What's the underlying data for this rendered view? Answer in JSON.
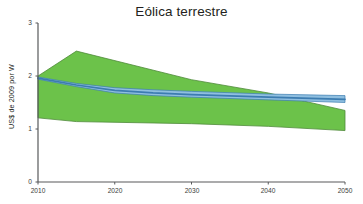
{
  "chart_data": {
    "type": "area",
    "title": "Eólica terrestre",
    "xlabel": "",
    "ylabel": "US$ de 2009 por W",
    "xlim": [
      2010,
      2050
    ],
    "ylim": [
      0,
      3
    ],
    "xticks": [
      "2010",
      "2020",
      "2030",
      "2040",
      "2050"
    ],
    "yticks": [
      "0",
      "1",
      "2",
      "3"
    ],
    "grid": false,
    "legend": "none",
    "colors": {
      "range_band": "#6cc24a",
      "range_band_edge": "#4f8a3a",
      "projection_band": "#8fbfe0",
      "projection_line": "#3c7cb0",
      "axis": "#58595b",
      "text": "#231f20"
    },
    "series": [
      {
        "name": "Intervalo de costos (banda verde)",
        "kind": "band",
        "x": [
          2010,
          2015,
          2030,
          2040,
          2050
        ],
        "upper": [
          2.0,
          2.47,
          1.93,
          1.68,
          1.35
        ],
        "lower": [
          1.21,
          1.14,
          1.1,
          1.05,
          0.97
        ]
      },
      {
        "name": "Proyección central (banda azul)",
        "kind": "band",
        "x": [
          2010,
          2015,
          2020,
          2025,
          2030,
          2040,
          2050
        ],
        "upper": [
          1.98,
          1.86,
          1.78,
          1.74,
          1.71,
          1.66,
          1.63
        ],
        "lower": [
          1.94,
          1.8,
          1.68,
          1.63,
          1.6,
          1.55,
          1.5
        ]
      },
      {
        "name": "Línea de tendencia",
        "kind": "line",
        "x": [
          2010,
          2015,
          2020,
          2025,
          2030,
          2040,
          2050
        ],
        "y": [
          1.96,
          1.83,
          1.73,
          1.68,
          1.65,
          1.6,
          1.56
        ]
      }
    ],
    "axes_geometry": {
      "x_pixel_2010": 38,
      "x_pixel_2050": 345,
      "y_pixel_0": 182,
      "y_pixel_3": 23
    }
  }
}
